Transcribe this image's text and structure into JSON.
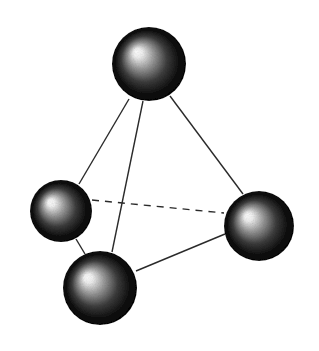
{
  "diagram": {
    "type": "tetrahedral-molecule",
    "colors": {
      "background": "#ffffff",
      "bond": "#2a2a2a",
      "sphere_dark": "#050505",
      "sphere_highlight": "#ffffff"
    },
    "spheres": [
      {
        "id": "top",
        "cx": 149,
        "cy": 64,
        "r": 37,
        "hx": 0.33,
        "hy": 0.33
      },
      {
        "id": "left",
        "cx": 61,
        "cy": 211,
        "r": 31,
        "hx": 0.32,
        "hy": 0.35
      },
      {
        "id": "right",
        "cx": 259,
        "cy": 226,
        "r": 35,
        "hx": 0.33,
        "hy": 0.35
      },
      {
        "id": "bottom",
        "cx": 100,
        "cy": 288,
        "r": 37,
        "hx": 0.32,
        "hy": 0.35
      }
    ],
    "bonds": [
      {
        "id": "top-left",
        "x1": 129,
        "y1": 99,
        "x2": 79,
        "y2": 184,
        "style": "solid"
      },
      {
        "id": "top-bottom",
        "x1": 143,
        "y1": 101,
        "x2": 112,
        "y2": 252,
        "style": "solid"
      },
      {
        "id": "top-right",
        "x1": 170,
        "y1": 96,
        "x2": 243,
        "y2": 194,
        "style": "solid"
      },
      {
        "id": "left-bottom",
        "x1": 76,
        "y1": 239,
        "x2": 85,
        "y2": 254,
        "style": "solid"
      },
      {
        "id": "bottom-right",
        "x1": 136,
        "y1": 271,
        "x2": 225,
        "y2": 234,
        "style": "solid"
      },
      {
        "id": "left-right",
        "x1": 92,
        "y1": 200,
        "x2": 224,
        "y2": 213,
        "style": "dashed"
      }
    ]
  }
}
